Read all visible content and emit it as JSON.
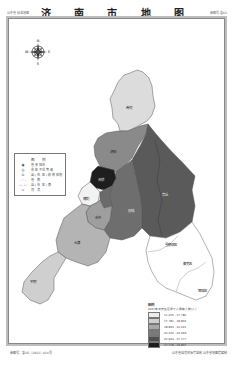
{
  "header": {
    "left_text": "山东省标准地图",
    "title": "济 南 市 地 图",
    "right_text": "审图号·鲁SG"
  },
  "compass": {
    "n": "N",
    "s": "S",
    "e": "E",
    "w": "W"
  },
  "districts": [
    {
      "name": "商河",
      "fill": "#dcdcdc"
    },
    {
      "name": "济阳",
      "fill": "#8a8a8a"
    },
    {
      "name": "章丘",
      "fill": "#5a5a5a"
    },
    {
      "name": "历城",
      "fill": "#6e6e6e"
    },
    {
      "name": "天桥",
      "fill": "#1e1e1e"
    },
    {
      "name": "槐荫",
      "fill": "#f2f2f2"
    },
    {
      "name": "市中",
      "fill": "#9e9e9e"
    },
    {
      "name": "历下",
      "fill": "#6a6a6a"
    },
    {
      "name": "长清",
      "fill": "#b4b4b4"
    },
    {
      "name": "平阴",
      "fill": "#cfcfcf"
    },
    {
      "name": "莱芜区",
      "fill": "#ffffff"
    },
    {
      "name": "钢城区",
      "fill": "#ffffff"
    },
    {
      "name": "雪野湖区",
      "fill": "#ffffff"
    }
  ],
  "legend": {
    "title": "图 例",
    "items": [
      {
        "symbol": "◉",
        "label": "省会城市"
      },
      {
        "symbol": "◎",
        "label": "市区不详等级"
      },
      {
        "symbol": "⊙",
        "label": "县(市,区)政府驻地"
      },
      {
        "symbol": "- · -",
        "label": "省 界"
      },
      {
        "symbol": "— —",
        "label": "县(市,区)界"
      },
      {
        "symbol": "≈",
        "label": "河 流"
      }
    ]
  },
  "choropleth": {
    "title": "图例",
    "subtitle": "2021年济南各区县千人拥有人数(人)",
    "classes": [
      {
        "range": "11.615 - 17.780",
        "color": "#ececec"
      },
      {
        "range": "17.781 - 18.832",
        "color": "#cfcfcf"
      },
      {
        "range": "18.833 - 20.221",
        "color": "#a9a9a9"
      },
      {
        "range": "20.222 - 22.963",
        "color": "#7a7a7a"
      },
      {
        "range": "22.964 - 27.177",
        "color": "#4f4f4f"
      },
      {
        "range": "27.178 - 33.837",
        "color": "#1e1e1e"
      }
    ]
  },
  "footer": {
    "left_text": "审图号：鲁SG（2022）024号",
    "right_text": "山东省自然资源厅监制  山东省地图院编制"
  }
}
